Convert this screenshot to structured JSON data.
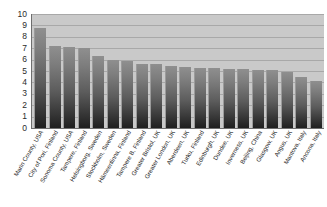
{
  "chart_data": {
    "type": "bar",
    "title": "",
    "subtitle": "",
    "xlabel": "",
    "ylabel": "",
    "ylim": [
      0,
      10
    ],
    "ytick_interval": 1,
    "grid": true,
    "legend": "none",
    "orientation": "vertical",
    "sorted": "descending",
    "categories": [
      "Marin County, USA",
      "City of Pori, Finland",
      "Sonoma County, USA",
      "Tampere, Finland",
      "Helsingborg, Sweden",
      "Stockholm, Sweden",
      "Hämeenlinna, Finland",
      "Tampere B, Finland",
      "Greater Bristol, UK",
      "Greater London, UK",
      "Aberdeen, UK",
      "Turku, Finland",
      "Edinburgh, UK",
      "Dundee, UK",
      "Inverness, UK",
      "Beijing, China",
      "Glasgow, UK",
      "Angus, UK",
      "Mantova, Italy",
      "Ancona, Italy"
    ],
    "values": [
      8.8,
      7.2,
      7.15,
      7.0,
      6.3,
      5.95,
      5.9,
      5.65,
      5.6,
      5.4,
      5.35,
      5.3,
      5.25,
      5.2,
      5.15,
      5.1,
      5.05,
      4.9,
      4.5,
      4.1
    ],
    "ytick_labels": [
      "10",
      "9",
      "8",
      "7",
      "6",
      "5",
      "4",
      "3",
      "2",
      "1",
      "0"
    ],
    "colors": {
      "plot_background": "#c9c9c9",
      "gridline": "#a8a8a8",
      "axis_line": "#6e6e6e",
      "bar_top": "#8f8f8f",
      "bar_bottom": "#1f1f1f",
      "text": "#1e1e1e",
      "page_background": "#ffffff"
    }
  }
}
